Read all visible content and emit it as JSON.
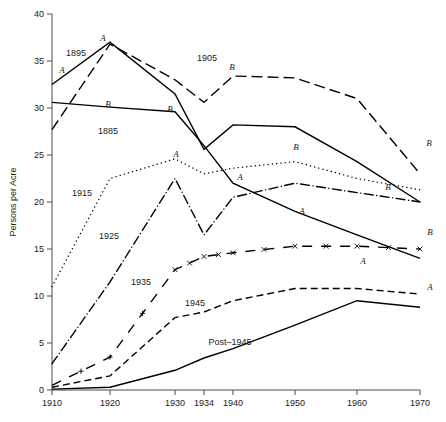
{
  "chart_data": {
    "type": "line",
    "title": "",
    "xlabel": "",
    "ylabel": "Persons per Acre",
    "x": [
      1910,
      1920,
      1930,
      1934,
      1940,
      1950,
      1960,
      1970
    ],
    "xtick_labels": [
      "1910",
      "1920",
      "1930",
      "1934",
      "1940",
      "1950",
      "1960",
      "1970"
    ],
    "ytick_labels": [
      "0",
      "5",
      "10",
      "15",
      "20",
      "25",
      "30",
      "35",
      "40"
    ],
    "ytick_values": [
      0,
      5,
      10,
      15,
      20,
      25,
      30,
      35,
      40
    ],
    "xlim": [
      1910,
      1970
    ],
    "ylim": [
      0,
      40
    ],
    "grid": false,
    "legend": "inline-annotations",
    "series": [
      {
        "name": "1885",
        "label": "1885",
        "style": "solid",
        "end_marker": "B",
        "values": [
          30.6,
          30.1,
          29.6,
          26.0,
          22.0,
          19.0,
          16.5,
          14.0
        ]
      },
      {
        "name": "1895",
        "label": "1895",
        "style": "solid",
        "end_marker": "B",
        "values": [
          32.5,
          37.0,
          31.5,
          25.6,
          28.2,
          28.0,
          24.3,
          20.0
        ]
      },
      {
        "name": "1905",
        "label": "1905",
        "style": "dashed",
        "end_marker": "B",
        "values": [
          27.7,
          36.8,
          33.0,
          30.6,
          33.4,
          33.2,
          31.0,
          23.0
        ]
      },
      {
        "name": "1915",
        "label": "1915",
        "style": "dotted",
        "end_marker": "B",
        "values": [
          11.0,
          22.5,
          24.6,
          23.0,
          23.6,
          24.3,
          22.5,
          21.3
        ]
      },
      {
        "name": "1925",
        "label": "1925",
        "style": "dash-dot",
        "end_marker": "B",
        "values": [
          2.8,
          11.5,
          22.5,
          16.5,
          20.5,
          22.0,
          21.0,
          20.0
        ]
      },
      {
        "name": "1935",
        "label": "1935",
        "style": "dash-x",
        "end_marker": "B",
        "values": [
          0.5,
          3.5,
          12.8,
          14.2,
          14.6,
          15.3,
          15.3,
          15.0
        ]
      },
      {
        "name": "1945",
        "label": "1945",
        "style": "dashed-fine",
        "end_marker": "A",
        "values": [
          0.3,
          1.5,
          7.7,
          8.3,
          9.5,
          10.8,
          10.8,
          10.2
        ]
      },
      {
        "name": "Post-1945",
        "label": "Post–1945",
        "style": "solid",
        "end_marker": "A",
        "values": [
          0.1,
          0.3,
          2.1,
          3.4,
          4.4,
          6.9,
          9.5,
          8.8
        ]
      }
    ],
    "inline_labels": [
      {
        "text": "1895",
        "x": 76,
        "y": 56
      },
      {
        "text": "1885",
        "x": 108,
        "y": 134
      },
      {
        "text": "1905",
        "x": 207,
        "y": 61
      },
      {
        "text": "1915",
        "x": 82,
        "y": 196
      },
      {
        "text": "1925",
        "x": 109,
        "y": 239
      },
      {
        "text": "1935",
        "x": 141,
        "y": 285
      },
      {
        "text": "1945",
        "x": 195,
        "y": 306
      },
      {
        "text": "Post–1945",
        "x": 230,
        "y": 345
      }
    ],
    "marker_labels": [
      {
        "text": "A",
        "x": 62,
        "y": 73
      },
      {
        "text": "A",
        "x": 103,
        "y": 41
      },
      {
        "text": "B",
        "x": 108,
        "y": 107
      },
      {
        "text": "B",
        "x": 170,
        "y": 112
      },
      {
        "text": "B",
        "x": 232,
        "y": 70
      },
      {
        "text": "A",
        "x": 176,
        "y": 157
      },
      {
        "text": "A",
        "x": 240,
        "y": 180
      },
      {
        "text": "B",
        "x": 296,
        "y": 150
      },
      {
        "text": "B",
        "x": 388,
        "y": 190
      },
      {
        "text": "A",
        "x": 302,
        "y": 214
      },
      {
        "text": "A",
        "x": 363,
        "y": 264
      },
      {
        "text": "B",
        "x": 429,
        "y": 146
      },
      {
        "text": "B",
        "x": 430,
        "y": 235
      },
      {
        "text": "A",
        "x": 430,
        "y": 290
      }
    ]
  }
}
